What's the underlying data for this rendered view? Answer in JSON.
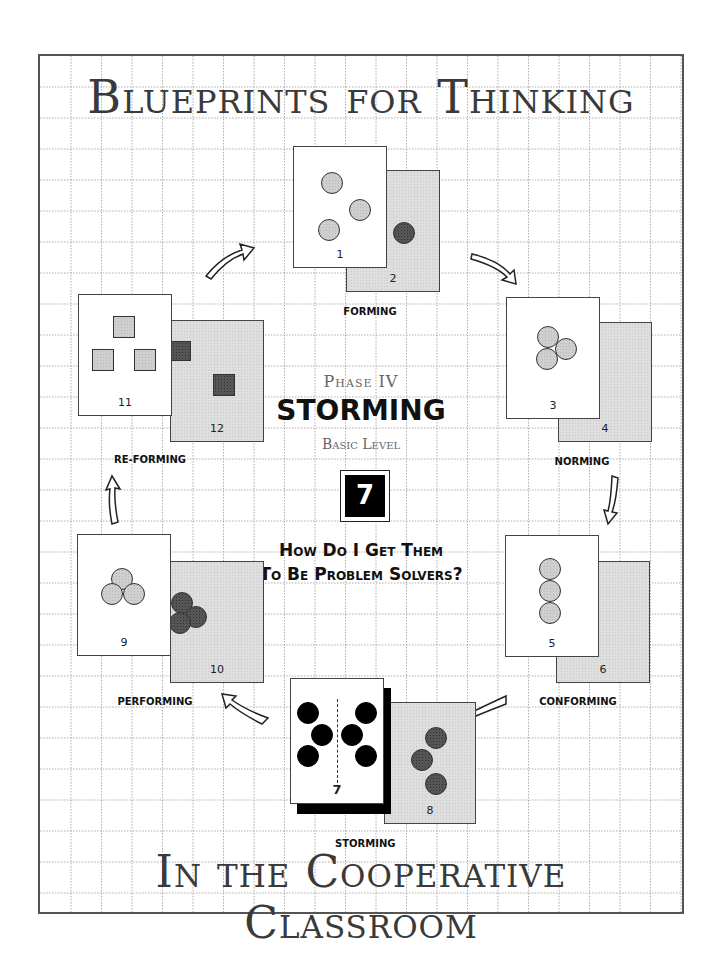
{
  "header": {
    "title": "Blueprints for Thinking"
  },
  "footer": {
    "title": "In the Cooperative Classroom"
  },
  "center": {
    "phase": "Phase IV",
    "stage": "STORMING",
    "level": "Basic Level",
    "number": "7",
    "question_line1": "How Do I Get Them",
    "question_line2": "To Be Problem Solvers?"
  },
  "stages": [
    {
      "label": "FORMING",
      "front_number": "1",
      "back_number": "2",
      "shape": "circle",
      "arrangement": "scattered"
    },
    {
      "label": "NORMING",
      "front_number": "3",
      "back_number": "4",
      "shape": "circle",
      "arrangement": "cluster"
    },
    {
      "label": "CONFORMING",
      "front_number": "5",
      "back_number": "6",
      "shape": "circle",
      "arrangement": "vertical-stack"
    },
    {
      "label": "STORMING",
      "front_number": "7",
      "back_number": "8",
      "shape": "circle",
      "arrangement": "split-groups"
    },
    {
      "label": "PERFORMING",
      "front_number": "9",
      "back_number": "10",
      "shape": "circle",
      "arrangement": "cluster"
    },
    {
      "label": "RE-FORMING",
      "front_number": "11",
      "back_number": "12",
      "shape": "square",
      "arrangement": "scattered"
    }
  ],
  "colors": {
    "border": "#555555",
    "grid": "#888888",
    "light_shape": "#cfcfcf",
    "dark_shape": "#555555",
    "back_card": "#dedede"
  }
}
